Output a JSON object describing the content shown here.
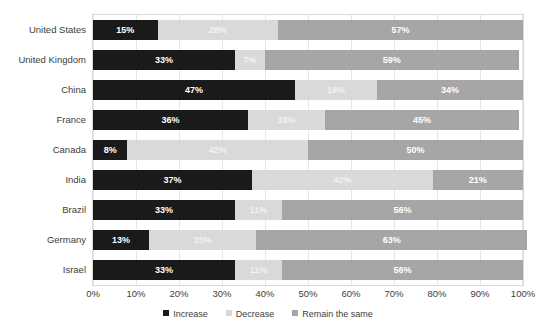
{
  "chart_data": {
    "type": "bar",
    "orientation": "horizontal",
    "stacked": true,
    "stack_mode": "percent",
    "title": "",
    "subtitle": "",
    "xlabel": "",
    "ylabel": "",
    "xlim": [
      0,
      100
    ],
    "grid": true,
    "legend_position": "bottom",
    "xticks": [
      "0%",
      "10%",
      "20%",
      "30%",
      "40%",
      "50%",
      "60%",
      "70%",
      "80%",
      "90%",
      "100%"
    ],
    "xtick_values": [
      0,
      10,
      20,
      30,
      40,
      50,
      60,
      70,
      80,
      90,
      100
    ],
    "categories": [
      "United States",
      "United Kingdom",
      "China",
      "France",
      "Canada",
      "India",
      "Brazil",
      "Germany",
      "Israel"
    ],
    "series": [
      {
        "name": "Increase",
        "color": "#1a1a1a",
        "values": [
          15,
          33,
          47,
          36,
          8,
          37,
          33,
          13,
          33
        ],
        "labels": [
          "15%",
          "33%",
          "47%",
          "36%",
          "8%",
          "37%",
          "33%",
          "13%",
          "33%"
        ]
      },
      {
        "name": "Decrease",
        "color": "#d9d9d9",
        "values": [
          28,
          7,
          19,
          18,
          42,
          42,
          11,
          25,
          11
        ],
        "labels": [
          "28%",
          "7%",
          "19%",
          "18%",
          "42%",
          "42%",
          "11%",
          "25%",
          "11%"
        ]
      },
      {
        "name": "Remain the same",
        "color": "#a6a6a6",
        "values": [
          57,
          59,
          34,
          45,
          50,
          21,
          56,
          63,
          56
        ],
        "labels": [
          "57%",
          "59%",
          "34%",
          "45%",
          "50%",
          "21%",
          "56%",
          "63%",
          "56%"
        ]
      }
    ]
  }
}
